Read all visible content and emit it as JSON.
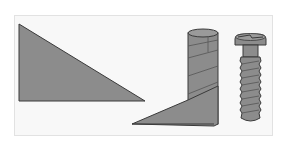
{
  "diagram": {
    "title": "Inclined plane wrapped around a cylinder forms a screw",
    "colors": {
      "fill": "#8c8c8c",
      "stroke": "#3a3a3a",
      "frame_bg": "#f8f8f8",
      "frame_border": "#e2e2e2",
      "thread_line": "#555555"
    },
    "panels": [
      {
        "id": "inclined-plane",
        "label": "Inclined plane (right triangle)"
      },
      {
        "id": "wrapped-plane",
        "label": "Triangle wrapped around cylinder"
      },
      {
        "id": "screw",
        "label": "Screw"
      }
    ]
  }
}
